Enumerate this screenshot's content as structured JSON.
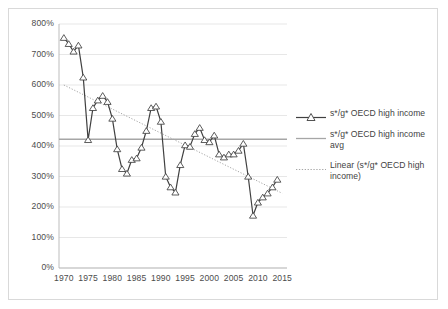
{
  "chart_data": {
    "type": "line",
    "title": "",
    "subtitle": "",
    "xlabel": "",
    "ylabel": "",
    "xlim": [
      1969,
      2016
    ],
    "ylim": [
      0,
      800
    ],
    "grid": true,
    "y_tick_labels": [
      "800%",
      "700%",
      "600%",
      "500%",
      "400%",
      "300%",
      "200%",
      "100%",
      "0%"
    ],
    "y_ticks": [
      800,
      700,
      600,
      500,
      400,
      300,
      200,
      100,
      0
    ],
    "x_tick_labels": [
      "1970",
      "1975",
      "1980",
      "1985",
      "1990",
      "1995",
      "2000",
      "2005",
      "2010",
      "2015"
    ],
    "x_ticks": [
      1970,
      1975,
      1980,
      1985,
      1990,
      1995,
      2000,
      2005,
      2010,
      2015
    ],
    "legend_position": "right",
    "x": [
      1970,
      1971,
      1972,
      1973,
      1974,
      1975,
      1976,
      1977,
      1978,
      1979,
      1980,
      1981,
      1982,
      1983,
      1984,
      1985,
      1986,
      1987,
      1988,
      1989,
      1990,
      1991,
      1992,
      1993,
      1994,
      1995,
      1996,
      1997,
      1998,
      1999,
      2000,
      2001,
      2002,
      2003,
      2004,
      2005,
      2006,
      2007,
      2008,
      2009,
      2010,
      2011,
      2012,
      2013,
      2014
    ],
    "series": [
      {
        "name": "s*/g* OECD high income",
        "style": "line-with-triangle-markers",
        "color": "#404040",
        "values": [
          755,
          735,
          710,
          730,
          625,
          420,
          525,
          550,
          565,
          545,
          490,
          390,
          325,
          310,
          355,
          360,
          395,
          450,
          525,
          530,
          480,
          300,
          265,
          248,
          338,
          403,
          398,
          440,
          460,
          420,
          413,
          435,
          373,
          363,
          373,
          373,
          385,
          408,
          300,
          172,
          215,
          232,
          245,
          265,
          290
        ]
      },
      {
        "name": "s*/g* OECD high income avg",
        "style": "horizontal-solid-line",
        "color": "#a6a6a6",
        "value": 422
      },
      {
        "name": "Linear (s*/g* OECD high income)",
        "style": "dotted-trendline",
        "color": "#a6a6a6",
        "endpoints": [
          {
            "x": 1970,
            "y": 600
          },
          {
            "x": 2015,
            "y": 245
          }
        ]
      }
    ]
  },
  "legend": {
    "items": [
      {
        "label": "s*/g* OECD high income",
        "key": "line-marker-key"
      },
      {
        "label": "s*/g* OECD high income avg",
        "key": "solid-line-key"
      },
      {
        "label": "Linear (s*/g* OECD high income)",
        "key": "dotted-line-key"
      }
    ]
  }
}
